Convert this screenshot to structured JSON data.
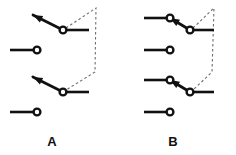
{
  "figure": {
    "type": "diagram",
    "background_color": "#ffffff",
    "line_color": "#111111",
    "dashed_link_color": "#6e6e6e",
    "terminal_fill": "#ffffff"
  },
  "panels": [
    {
      "id": "panel-a",
      "label": "A",
      "label_pos": {
        "x": 52,
        "y": 146
      },
      "rows": [
        {
          "id": "a-row-1",
          "kind": "switch-open-left",
          "pivot": {
            "x": 63,
            "y": 30
          },
          "lever_tip": {
            "x": 33,
            "y": 15
          },
          "stub_end": {
            "x": 89,
            "y": 30
          },
          "has_left_contact": false,
          "has_arrow": true
        },
        {
          "id": "a-row-2",
          "kind": "contact-lead",
          "lead_start": {
            "x": 10,
            "y": 50
          },
          "terminal": {
            "x": 37,
            "y": 50
          },
          "has_arrow": false
        },
        {
          "id": "a-row-3",
          "kind": "switch-open-left",
          "pivot": {
            "x": 63,
            "y": 92
          },
          "lever_tip": {
            "x": 33,
            "y": 77
          },
          "stub_end": {
            "x": 89,
            "y": 92
          },
          "has_left_contact": false,
          "has_arrow": true
        },
        {
          "id": "a-row-4",
          "kind": "contact-lead",
          "lead_start": {
            "x": 10,
            "y": 112
          },
          "terminal": {
            "x": 37,
            "y": 112
          },
          "has_arrow": false
        }
      ],
      "linkage": {
        "id": "a-linkage",
        "style": "dashed",
        "points": [
          {
            "x": 66,
            "y": 28
          },
          {
            "x": 96,
            "y": 8
          },
          {
            "x": 95,
            "y": 72
          },
          {
            "x": 66,
            "y": 90
          }
        ]
      }
    },
    {
      "id": "panel-b",
      "label": "B",
      "label_pos": {
        "x": 173,
        "y": 146
      },
      "rows": [
        {
          "id": "b-row-1",
          "kind": "switch-closed-left",
          "pivot": {
            "x": 190,
            "y": 30
          },
          "left_terminal": {
            "x": 170,
            "y": 18
          },
          "lead_start": {
            "x": 144,
            "y": 18
          },
          "stub_end": {
            "x": 214,
            "y": 30
          },
          "has_left_contact": true,
          "has_arrow": true
        },
        {
          "id": "b-row-2",
          "kind": "contact-lead",
          "lead_start": {
            "x": 144,
            "y": 50
          },
          "terminal": {
            "x": 170,
            "y": 50
          },
          "has_arrow": false
        },
        {
          "id": "b-row-3",
          "kind": "switch-closed-left",
          "pivot": {
            "x": 190,
            "y": 92
          },
          "left_terminal": {
            "x": 170,
            "y": 80
          },
          "lead_start": {
            "x": 144,
            "y": 80
          },
          "stub_end": {
            "x": 214,
            "y": 92
          },
          "has_left_contact": true,
          "has_arrow": true
        },
        {
          "id": "b-row-4",
          "kind": "contact-lead",
          "lead_start": {
            "x": 144,
            "y": 112
          },
          "terminal": {
            "x": 170,
            "y": 112
          },
          "has_arrow": false
        }
      ],
      "linkage": {
        "id": "b-linkage",
        "style": "dashed",
        "points": [
          {
            "x": 193,
            "y": 28
          },
          {
            "x": 214,
            "y": 8
          },
          {
            "x": 212,
            "y": 72
          },
          {
            "x": 193,
            "y": 90
          }
        ]
      }
    }
  ],
  "terminal_radius": 3.4
}
